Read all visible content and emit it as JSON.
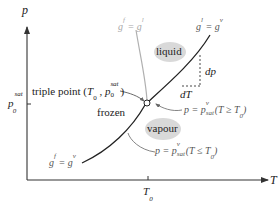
{
  "diagram": {
    "type": "phase-diagram",
    "axes": {
      "y_label": "p",
      "x_label": "T",
      "y_tick_label_base": "p",
      "y_tick_label_sub": "0",
      "y_tick_label_sup": "sat",
      "x_tick_label_base": "T",
      "x_tick_label_sub": "0"
    },
    "curves": {
      "fusion": {
        "label_lhs": "g",
        "lhs_sup": "f",
        "eq": " = ",
        "label_rhs": "g",
        "rhs_sup": "l"
      },
      "vaporization": {
        "label_lhs": "g",
        "lhs_sup": "l",
        "eq": " = ",
        "label_rhs": "g",
        "rhs_sup": "v"
      },
      "sublimation": {
        "label_lhs": "g",
        "lhs_sup": "f",
        "eq": " = ",
        "label_rhs": "g",
        "rhs_sup": "v"
      }
    },
    "regions": {
      "liquid": "liquid",
      "vapour": "vapour",
      "frozen": "frozen"
    },
    "triple_point": {
      "text": "triple point (",
      "T": "T",
      "T_sub": "0",
      "sep": " , ",
      "p": "p",
      "p_sub": "0",
      "p_sup": "sat",
      "close": ")"
    },
    "slope": {
      "dp": "dp",
      "dT": "dT"
    },
    "annotations": {
      "upper": {
        "lhs": "p = p",
        "sub": "sat",
        "sup": "v",
        "cond_open": "(",
        "cond": "T ≥ T",
        "cond_sub": "0",
        "cond_close": ")"
      },
      "lower": {
        "lhs": "p = p",
        "sub": "sat",
        "sup": "v",
        "cond_open": "(",
        "cond": "T ≤ T",
        "cond_sub": "0",
        "cond_close": ")"
      }
    },
    "colors": {
      "main_curve": "#222222",
      "fusion_curve": "#b0b0b0",
      "region_fill": "#d9d9d9",
      "axis": "#333333",
      "leader": "#666666"
    }
  }
}
